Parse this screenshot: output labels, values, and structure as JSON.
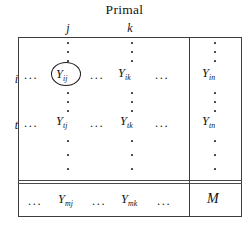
{
  "figure": {
    "title": "Primal",
    "column_headers": [
      {
        "name": "j",
        "label": "j"
      },
      {
        "name": "k",
        "label": "k"
      }
    ],
    "row_labels": [
      {
        "name": "i",
        "label": "i"
      },
      {
        "name": "t",
        "label": "t"
      }
    ],
    "ellipsis": {
      "horizontal": "...",
      "vertical": "⋮"
    },
    "cells": {
      "ij": {
        "base": "Y",
        "sub": "ij",
        "circled": true
      },
      "ik": {
        "base": "Y",
        "sub": "ik",
        "circled": false
      },
      "in": {
        "base": "Y",
        "sub": "in",
        "circled": false
      },
      "tj": {
        "base": "Y",
        "sub": "tj",
        "circled": false
      },
      "tk": {
        "base": "Y",
        "sub": "tk",
        "circled": false
      },
      "tn": {
        "base": "Y",
        "sub": "tn",
        "circled": false
      },
      "mj": {
        "base": "Y",
        "sub": "mj",
        "circled": false
      },
      "mk": {
        "base": "Y",
        "sub": "mk",
        "circled": false
      },
      "M": {
        "base": "M",
        "sub": "",
        "circled": false
      }
    },
    "colors": {
      "ink": "#141414",
      "rule": "#3d3d3d",
      "background": "#ffffff"
    }
  }
}
